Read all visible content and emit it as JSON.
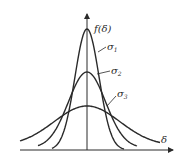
{
  "figure": {
    "y_axis_label": "f(δ)",
    "x_axis_label": "δ",
    "curves": [
      {
        "label": "σ",
        "subscript": "1",
        "peak_height": 121
      },
      {
        "label": "σ",
        "subscript": "2",
        "peak_height": 78
      },
      {
        "label": "σ",
        "subscript": "3",
        "peak_height": 44
      }
    ]
  },
  "chart_data": {
    "type": "line",
    "title": "",
    "xlabel": "δ",
    "ylabel": "f(δ)",
    "grid": false,
    "legend_position": "inline annotations",
    "series": [
      {
        "name": "σ1",
        "description": "narrowest, tallest normal curve",
        "relative_peak": 1.0,
        "relative_sigma": 1.0
      },
      {
        "name": "σ2",
        "description": "medium normal curve",
        "relative_peak": 0.64,
        "relative_sigma": 1.55
      },
      {
        "name": "σ3",
        "description": "widest, flattest normal curve",
        "relative_peak": 0.36,
        "relative_sigma": 2.75
      }
    ],
    "annotations": [
      "σ1 > peak tallest",
      "σ1 < σ2 < σ3"
    ]
  },
  "colors": {
    "stroke": "#2a2a2a",
    "background": "#ffffff"
  }
}
